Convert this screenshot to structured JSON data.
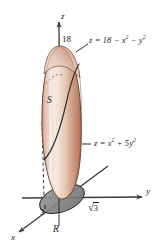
{
  "figure": {
    "kind": "3d-solid-region-diagram",
    "background_color": "#ffffff",
    "axes": [
      {
        "id": "z",
        "label": "z",
        "direction": "up",
        "x": 63,
        "y": 16
      },
      {
        "id": "y",
        "label": "y",
        "direction": "right",
        "x": 148,
        "y": 192
      },
      {
        "id": "x",
        "label": "x",
        "direction": "down-left",
        "x": 13,
        "y": 238
      }
    ],
    "labels": [
      {
        "id": "top-intercept",
        "name": "z-intercept-18",
        "text": "18",
        "x": 62,
        "y": 40,
        "style": "number"
      },
      {
        "id": "solid-name",
        "name": "solid-label-S",
        "text": "S",
        "x": 48,
        "y": 101,
        "style": "set"
      },
      {
        "id": "region-name",
        "name": "region-label-R",
        "text": "R",
        "x": 54,
        "y": 230,
        "style": "set"
      },
      {
        "id": "x-intercept-3",
        "name": "x-intercept-3",
        "text": "3",
        "x": 41,
        "y": 213,
        "style": "number"
      }
    ],
    "equations": [
      {
        "id": "upper-surface",
        "name": "upper-paraboloid-equation",
        "lhs": "z",
        "rhs_parts": [
          {
            "text": "= 18 "
          },
          {
            "text": "− "
          },
          {
            "text": "x",
            "sup": "2"
          },
          {
            "text": " − "
          },
          {
            "text": "y",
            "sup": "2"
          }
        ],
        "plain": "z = 18 − x² − y²",
        "x": 80,
        "y": 41
      },
      {
        "id": "lower-surface",
        "name": "lower-paraboloid-equation",
        "lhs": "z",
        "rhs_parts": [
          {
            "text": "= "
          },
          {
            "text": "x",
            "sup": "2"
          },
          {
            "text": " + 5"
          },
          {
            "text": "y",
            "sup": "2"
          }
        ],
        "plain": "z = x² + 5y²",
        "x": 90,
        "y": 144
      }
    ],
    "radical": {
      "id": "y-intercept",
      "name": "y-intercept-sqrt3",
      "symbol": "√",
      "radicand": "3",
      "plain": "√3",
      "x": 89,
      "y": 206
    },
    "colors": {
      "solid_highlight": "#f6ece6",
      "solid_mid": "#e3c3b2",
      "solid_shadow": "#b9806a",
      "solid_outline": "#6b4636",
      "region_fill": "#8f8f8f",
      "region_fill_dark": "#6f6f6f",
      "region_outline": "#2a2a2a",
      "axis": "#3a3a3a",
      "text": "#1c1c1c",
      "dashed": "#3a3a3a"
    },
    "geometry": {
      "origin": {
        "x": 62,
        "y": 198
      },
      "z_axis_top": {
        "x": 59,
        "y": 20
      },
      "y_axis_end": {
        "x": 142,
        "y": 198
      },
      "x_axis_end": {
        "x": 18,
        "y": 233
      },
      "solid_top": {
        "x": 60,
        "y": 46
      },
      "solid_bottom": {
        "x": 62,
        "y": 199
      },
      "solid_half_width": 18,
      "region_ellipse": {
        "cx": 62,
        "cy": 199,
        "rx": 23,
        "ry": 12.5,
        "rotation_deg": -22
      }
    }
  }
}
